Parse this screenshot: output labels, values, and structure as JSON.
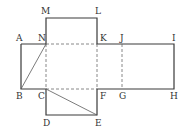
{
  "diagram": {
    "type": "cube-net",
    "points": {
      "A": [
        21,
        44
      ],
      "N": [
        46,
        44
      ],
      "M": [
        46,
        18
      ],
      "L": [
        97,
        18
      ],
      "K": [
        97,
        44
      ],
      "J": [
        122,
        44
      ],
      "I": [
        174,
        44
      ],
      "H": [
        174,
        89
      ],
      "G": [
        122,
        89
      ],
      "F": [
        97,
        89
      ],
      "E": [
        97,
        115
      ],
      "D": [
        46,
        115
      ],
      "C": [
        46,
        89
      ],
      "B": [
        21,
        89
      ]
    },
    "labels": [
      {
        "text": "M",
        "x": 41,
        "y": 14
      },
      {
        "text": "L",
        "x": 95,
        "y": 14
      },
      {
        "text": "A",
        "x": 16,
        "y": 41
      },
      {
        "text": "N",
        "x": 38,
        "y": 41
      },
      {
        "text": "K",
        "x": 100,
        "y": 41
      },
      {
        "text": "J",
        "x": 120,
        "y": 41
      },
      {
        "text": "I",
        "x": 172,
        "y": 41
      },
      {
        "text": "B",
        "x": 16,
        "y": 99
      },
      {
        "text": "C",
        "x": 38,
        "y": 99
      },
      {
        "text": "F",
        "x": 100,
        "y": 99
      },
      {
        "text": "G",
        "x": 119,
        "y": 99
      },
      {
        "text": "H",
        "x": 170,
        "y": 99
      },
      {
        "text": "D",
        "x": 43,
        "y": 126
      },
      {
        "text": "E",
        "x": 95,
        "y": 126
      }
    ],
    "solid_edges": [
      "A-N",
      "N-M",
      "M-L",
      "L-K",
      "K-I",
      "I-H",
      "H-E?",
      "B-A",
      "B-C",
      "C-D",
      "D-E",
      "E-F",
      "F-H"
    ],
    "dashed_edges": [
      "N-K",
      "K-F",
      "J-G",
      "N-C",
      "C-F"
    ],
    "diagonals": [
      "N-B",
      "C-E"
    ]
  }
}
